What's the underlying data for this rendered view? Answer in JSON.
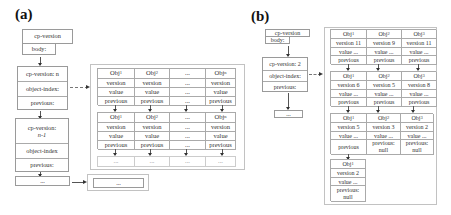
{
  "panel_a": {
    "label": "(a)",
    "root": {
      "title": "cp-version",
      "body": "body:"
    },
    "checkpoint_n": {
      "version": "cp-version: n",
      "index": "object-index:",
      "previous": "previous:"
    },
    "checkpoint_n1": {
      "version_line1": "cp-version:",
      "version_line2": "n-1",
      "index": "object-index",
      "previous": "previous:"
    },
    "ellipsis_box": "...",
    "bottom_ellipsis": "...",
    "table_1": {
      "headers": [
        "Obj1",
        "Obj2",
        "...",
        "Objn"
      ],
      "rows": [
        [
          "version",
          "version",
          "...",
          "version"
        ],
        [
          "value",
          "value",
          "...",
          "value"
        ],
        [
          "previous",
          "previous",
          "...",
          "previous"
        ]
      ]
    },
    "table_2": {
      "headers": [
        "Obj1",
        "Obj2",
        "...",
        "Objn"
      ],
      "rows": [
        [
          "version",
          "version",
          "...",
          "version"
        ],
        [
          "value",
          "value",
          "...",
          "value"
        ],
        [
          "previous",
          "previous",
          "...",
          "previous"
        ]
      ]
    },
    "continuation_row": [
      "...",
      "...",
      "...",
      "..."
    ]
  },
  "panel_b": {
    "label": "(b)",
    "root": {
      "title": "cp-version",
      "body": "body:"
    },
    "checkpoint": {
      "version": "cp-version: 2",
      "index": "object-index:",
      "previous": "previous:"
    },
    "ellipsis_box": "...",
    "level_1": [
      {
        "obj": "Obj1",
        "version": "version 11",
        "value": "value ...",
        "previous": "previous"
      },
      {
        "obj": "Obj2",
        "version": "version 9",
        "value": "value ...",
        "previous": "previous"
      },
      {
        "obj": "Obj3",
        "version": "version 11",
        "value": "value ...",
        "previous": "previous"
      }
    ],
    "level_2": [
      {
        "obj": "Obj1",
        "version": "version 6",
        "value": "value ...",
        "previous": "previous"
      },
      {
        "obj": "Obj2",
        "version": "version 5",
        "value": "value ...",
        "previous": "previous"
      },
      {
        "obj": "Obj3",
        "version": "version 8",
        "value": "value ...",
        "previous": "previous"
      }
    ],
    "level_3": [
      {
        "obj": "Obj1",
        "version": "version 5",
        "value": "value ...",
        "previous": "previous"
      },
      {
        "obj": "Obj2",
        "version": "version 3",
        "value": "value ...",
        "previous_l1": "previous:",
        "previous_l2": "null"
      },
      {
        "obj": "Obj3",
        "version": "version 2",
        "value": "value ...",
        "previous_l1": "previous:",
        "previous_l2": "null"
      }
    ],
    "level_4": [
      {
        "obj": "Obj1",
        "version": "version 2",
        "value": "value ...",
        "previous_l1": "previous:",
        "previous_l2": "null"
      }
    ]
  }
}
